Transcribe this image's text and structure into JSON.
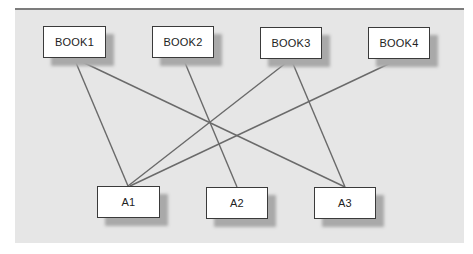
{
  "diagram": {
    "type": "bipartite-graph",
    "top_nodes": [
      {
        "id": "BOOK1",
        "label": "BOOK1",
        "x": 43,
        "y": 26
      },
      {
        "id": "BOOK2",
        "label": "BOOK2",
        "x": 152,
        "y": 26
      },
      {
        "id": "BOOK3",
        "label": "BOOK3",
        "x": 260,
        "y": 27
      },
      {
        "id": "BOOK4",
        "label": "BOOK4",
        "x": 368,
        "y": 27
      }
    ],
    "bottom_nodes": [
      {
        "id": "A1",
        "label": "A1",
        "x": 97,
        "y": 186
      },
      {
        "id": "A2",
        "label": "A2",
        "x": 206,
        "y": 187
      },
      {
        "id": "A3",
        "label": "A3",
        "x": 314,
        "y": 187
      }
    ],
    "edges": [
      {
        "from": "BOOK1",
        "to": "A1"
      },
      {
        "from": "BOOK1",
        "to": "A3"
      },
      {
        "from": "BOOK2",
        "to": "A2"
      },
      {
        "from": "BOOK3",
        "to": "A1"
      },
      {
        "from": "BOOK3",
        "to": "A3"
      },
      {
        "from": "BOOK4",
        "to": "A1"
      }
    ]
  },
  "colors": {
    "panel_background": "#e6e6e6",
    "panel_top_border": "#7c7c7c",
    "node_fill": "#ffffff",
    "node_border": "#3a3a3a",
    "node_shadow": "#a9a9a9",
    "edge": "#6a6a6a"
  }
}
